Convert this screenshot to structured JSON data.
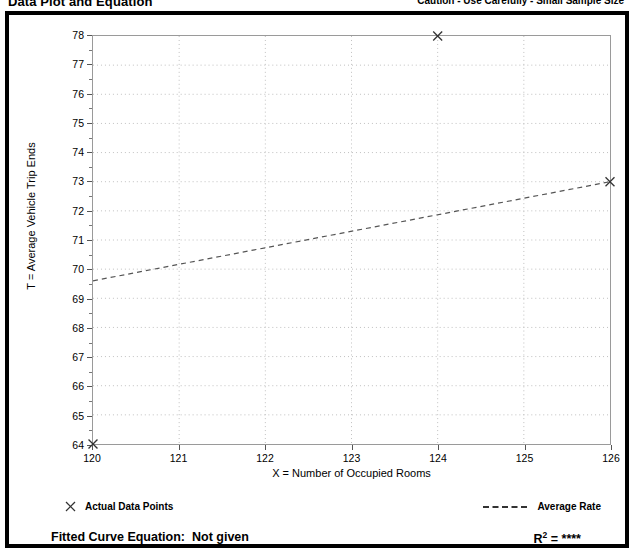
{
  "header": {
    "title": "Data Plot and Equation",
    "caution": "Caution - Use Carefully - Small Sample Size"
  },
  "legend": {
    "points_label": "Actual Data Points",
    "points_marker": "x-cross-marker",
    "rate_label": "Average Rate",
    "rate_marker": "dashed-line"
  },
  "equation": {
    "fitted_label": "Fitted Curve Equation:",
    "fitted_value": "Not given",
    "r_label": "R",
    "r_exponent": "2",
    "r_equals": " = ",
    "r_value": "****"
  },
  "chart_data": {
    "type": "scatter",
    "title": "Data Plot and Equation",
    "xlabel": "X = Number of Occupied Rooms",
    "ylabel": "T = Average Vehicle Trip Ends",
    "xlim": [
      120,
      126
    ],
    "ylim": [
      64,
      78
    ],
    "xticks": [
      120,
      121,
      122,
      123,
      124,
      125,
      126
    ],
    "yticks": [
      64,
      65,
      66,
      67,
      68,
      69,
      70,
      71,
      72,
      73,
      74,
      75,
      76,
      77,
      78
    ],
    "xtick_labels": [
      "120",
      "121",
      "122",
      "123",
      "124",
      "125",
      "126"
    ],
    "ytick_labels": [
      "64",
      "65",
      "66",
      "67",
      "68",
      "69",
      "70",
      "71",
      "72",
      "73",
      "74",
      "75",
      "76",
      "77",
      "78"
    ],
    "grid": true,
    "grid_style": "dotted",
    "grid_color": "#bfbfbf",
    "legend_position": "below-plot",
    "series": [
      {
        "name": "Actual Data Points",
        "type": "scatter",
        "marker": "x",
        "color": "#333333",
        "points": [
          {
            "x": 120,
            "y": 64
          },
          {
            "x": 124,
            "y": 78
          },
          {
            "x": 126,
            "y": 73
          }
        ]
      },
      {
        "name": "Average Rate",
        "type": "line",
        "style": "dashed",
        "color": "#555555",
        "points": [
          {
            "x": 120,
            "y": 69.6
          },
          {
            "x": 126,
            "y": 73.0
          }
        ]
      }
    ]
  }
}
